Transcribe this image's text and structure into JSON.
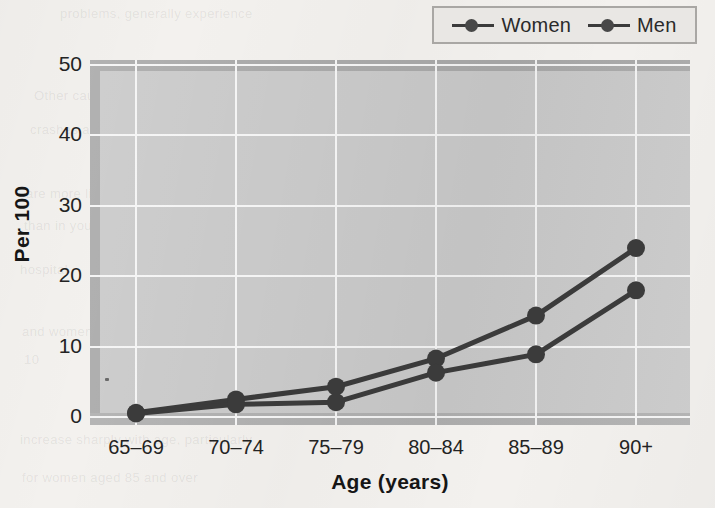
{
  "legend": {
    "position": "top-right",
    "entries": [
      {
        "label": "Women",
        "marker": "line-circle-marker",
        "color": "#3b3b3b"
      },
      {
        "label": "Men",
        "marker": "line-circle-marker",
        "color": "#3b3b3b"
      }
    ]
  },
  "axes": {
    "y_label": "Per 100",
    "x_label": "Age (years)",
    "y_ticks": [
      "0",
      "10",
      "20",
      "30",
      "40",
      "50"
    ],
    "x_ticks": [
      "65–69",
      "70–74",
      "75–79",
      "80–84",
      "85–89",
      "90+"
    ]
  },
  "colors": {
    "page_background": "#f3f1ee",
    "plot_background": "#c9c9c9",
    "plot_band": "#a9a9a9",
    "gridline": "#f4f4f4",
    "series_women": "#3b3b3b",
    "series_men": "#3b3b3b",
    "legend_background": "#e9e7e4",
    "legend_border": "#a9a7a4",
    "text": "#232323"
  },
  "bleed_text": [
    {
      "text": "problems, generally experience",
      "x": 60,
      "y": 6
    },
    {
      "text": "Other causes include motor vehicle",
      "x": 34,
      "y": 88
    },
    {
      "text": "crashes and other events",
      "x": 30,
      "y": 122
    },
    {
      "text": "are more likely to occur",
      "x": 26,
      "y": 186
    },
    {
      "text": "than in younger groups",
      "x": 24,
      "y": 218
    },
    {
      "text": "hospital",
      "x": 20,
      "y": 262
    },
    {
      "text": "and women living alone",
      "x": 22,
      "y": 324
    },
    {
      "text": "10",
      "x": 24,
      "y": 352
    },
    {
      "text": "increase sharply with age, particularly",
      "x": 20,
      "y": 432
    },
    {
      "text": "for women aged 85 and over",
      "x": 22,
      "y": 470
    }
  ],
  "chart_data": {
    "type": "line",
    "title": "",
    "xlabel": "Age (years)",
    "ylabel": "Per 100",
    "categories": [
      "65–69",
      "70–74",
      "75–79",
      "80–84",
      "85–89",
      "90+"
    ],
    "series": [
      {
        "name": "Women",
        "values": [
          0.6,
          2.5,
          4.3,
          8.3,
          14.4,
          24.0
        ]
      },
      {
        "name": "Men",
        "values": [
          0.5,
          1.8,
          2.1,
          6.3,
          8.9,
          18.0
        ]
      }
    ],
    "ylim": [
      0,
      50
    ],
    "ytick_values": [
      0,
      10,
      20,
      30,
      40,
      50
    ],
    "grid": "horizontal-and-vertical",
    "legend_position": "top-right",
    "marker": "filled-circle"
  }
}
